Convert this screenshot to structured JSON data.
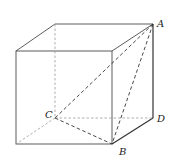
{
  "figure": {
    "type": "cube-with-triangle",
    "labels": {
      "A": "A",
      "B": "B",
      "C": "C",
      "D": "D"
    },
    "vertices": {
      "front_top_left": [
        16,
        51
      ],
      "front_top_right": [
        112,
        51
      ],
      "front_bottom_left": [
        16,
        144
      ],
      "B": [
        112,
        144
      ],
      "back_top_left": [
        55,
        24
      ],
      "A": [
        153,
        24
      ],
      "C": [
        55,
        118
      ],
      "D": [
        153,
        118
      ]
    },
    "segments": {
      "solid": [
        "front face",
        "top face",
        "right face A-D",
        "D-B"
      ],
      "hidden": [
        "back_top_left-C",
        "C-D",
        "C-front_bottom_left"
      ],
      "dashed_diagonals": [
        "A-C",
        "A-B",
        "C-B"
      ]
    },
    "colors": {
      "edge": "#4a4a4a",
      "hidden_edge": "#9a9a9a",
      "text": "#222222"
    }
  }
}
